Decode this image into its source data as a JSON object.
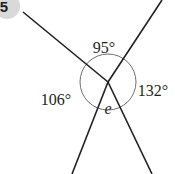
{
  "question": {
    "number": "5",
    "badge_color": "#d9d9d9"
  },
  "diagram": {
    "type": "angles-at-a-point",
    "center": [
      108,
      82
    ],
    "circle_radius": 28,
    "line_color": "#231f20",
    "circle_color": "#6d6e71",
    "rays": [
      {
        "name": "ray-upper-left",
        "end": [
          23,
          12
        ]
      },
      {
        "name": "ray-upper-right",
        "end": [
          162,
          0
        ]
      },
      {
        "name": "ray-lower-left",
        "end": [
          72,
          174
        ]
      },
      {
        "name": "ray-lower-right",
        "end": [
          152,
          174
        ]
      }
    ],
    "angles": [
      {
        "name": "angle-top",
        "label": "95°",
        "value": 95,
        "position": [
          104,
          53
        ]
      },
      {
        "name": "angle-right",
        "label": "132°",
        "value": 132,
        "position": [
          153,
          96
        ]
      },
      {
        "name": "angle-left",
        "label": "106°",
        "value": 106,
        "position": [
          56,
          105
        ]
      },
      {
        "name": "angle-bottom",
        "label": "e",
        "value": null,
        "position": [
          108,
          114
        ],
        "italic": true
      }
    ]
  }
}
